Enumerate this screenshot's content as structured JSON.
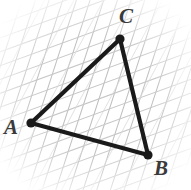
{
  "figure": {
    "background_color": "#ffffff",
    "width": 191,
    "height": 190,
    "grid": {
      "line_color": "#bdbdbd",
      "line_color_secondary": "#c9c9c9",
      "line_width": 1,
      "spacing": 13,
      "family_1_angle_deg": 72,
      "family_2_angle_deg": 160,
      "description": "two crossing families of faint pencil rules forming a tilted rhombic grid"
    },
    "triangle": {
      "stroke_color": "#1a1a1a",
      "stroke_width": 4,
      "vertex_dot_color": "#1a1a1a",
      "vertex_dot_radius": 4.5,
      "vertices": [
        {
          "name": "A",
          "label": "A",
          "x": 31,
          "y": 123,
          "label_x": 4,
          "label_y": 117
        },
        {
          "name": "B",
          "label": "B",
          "x": 148,
          "y": 155,
          "label_x": 154,
          "label_y": 158
        },
        {
          "name": "C",
          "label": "C",
          "x": 120,
          "y": 39,
          "label_x": 119,
          "label_y": 6
        }
      ],
      "edges": [
        {
          "name": "edge-AC",
          "from": "A",
          "to": "C"
        },
        {
          "name": "edge-CB",
          "from": "C",
          "to": "B"
        },
        {
          "name": "edge-BA",
          "from": "B",
          "to": "A"
        }
      ]
    }
  }
}
